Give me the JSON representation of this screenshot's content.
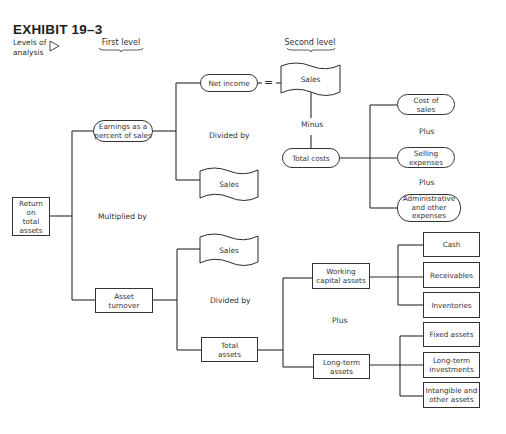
{
  "exhibit": {
    "title": "EXHIBIT 19–3",
    "levels_label": "Levels of analysis",
    "levels_label_line1": "Levels of",
    "levels_label_line2": "analysis",
    "first_level": "First level",
    "second_level": "Second level"
  },
  "nodes": {
    "return_on_total_assets": [
      "Return",
      "on",
      "total",
      "assets"
    ],
    "earnings_pct_sales": [
      "Earnings as a",
      "percent of sales"
    ],
    "net_income": "Net income",
    "sales_top": "Sales",
    "sales_mid": "Sales",
    "total_costs": "Total costs",
    "cost_of_sales": [
      "Cost of",
      "sales"
    ],
    "selling_expenses": [
      "Selling",
      "expenses"
    ],
    "admin_expenses": [
      "Administrative",
      "and other",
      "expenses"
    ],
    "asset_turnover": [
      "Asset",
      "turnover"
    ],
    "sales_bottom": "Sales",
    "total_assets": [
      "Total",
      "assets"
    ],
    "working_capital_assets": [
      "Working",
      "capital assets"
    ],
    "long_term_assets": [
      "Long-term",
      "assets"
    ],
    "cash": "Cash",
    "receivables": "Receivables",
    "inventories": "Inventories",
    "fixed_assets": "Fixed assets",
    "long_term_investments": [
      "Long-term",
      "investments"
    ],
    "intangible_other": [
      "Intangible and",
      "other assets"
    ]
  },
  "operators": {
    "multiplied_by": "Multiplied by",
    "divided_by_top": "Divided by",
    "divided_by_bottom": "Divided by",
    "equals": "=",
    "minus": "Minus",
    "plus_costs_1": "Plus",
    "plus_costs_2": "Plus",
    "plus_assets": "Plus"
  },
  "colors": {
    "line": "#2b2b2b",
    "background": "#ffffff",
    "text": "#333333"
  }
}
